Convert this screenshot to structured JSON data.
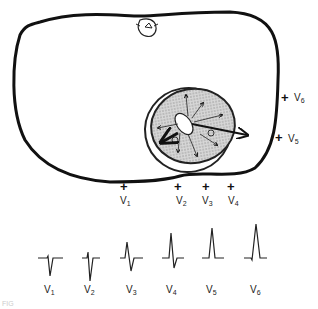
{
  "diagram": {
    "torso": {
      "description": "chest cross-section with vertebra at top"
    },
    "heart": {
      "description": "shaded ventricle cross-section with radiating depolarization arrows",
      "vector_labels": [
        "1",
        "2"
      ]
    },
    "electrodes": [
      {
        "id": "V1",
        "lead": "V",
        "sub": "1",
        "sign": "+"
      },
      {
        "id": "V2",
        "lead": "V",
        "sub": "2",
        "sign": "+"
      },
      {
        "id": "V3",
        "lead": "V",
        "sub": "3",
        "sign": "+"
      },
      {
        "id": "V4",
        "lead": "V",
        "sub": "4",
        "sign": "+"
      },
      {
        "id": "V5",
        "lead": "V",
        "sub": "5",
        "sign": "+"
      },
      {
        "id": "V6",
        "lead": "V",
        "sub": "6",
        "sign": "+"
      }
    ],
    "waveforms": [
      {
        "lead": "V",
        "sub": "1",
        "pattern": "rS"
      },
      {
        "lead": "V",
        "sub": "2",
        "pattern": "rS"
      },
      {
        "lead": "V",
        "sub": "3",
        "pattern": "RS"
      },
      {
        "lead": "V",
        "sub": "4",
        "pattern": "Rs"
      },
      {
        "lead": "V",
        "sub": "5",
        "pattern": "qR"
      },
      {
        "lead": "V",
        "sub": "6",
        "pattern": "qR"
      }
    ],
    "caption": "FIG"
  }
}
